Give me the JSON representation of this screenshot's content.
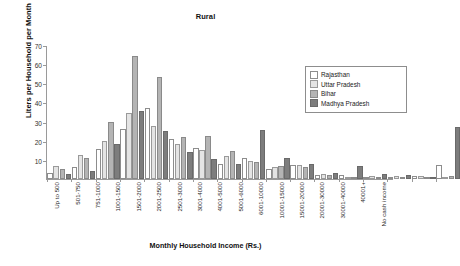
{
  "chart_data": {
    "type": "bar",
    "title": "Rural",
    "xlabel": "Monthly Household Income (Rs.)",
    "ylabel": "Liters per Household per Month",
    "ylim": [
      0,
      70
    ],
    "yticks": [
      0,
      10,
      20,
      30,
      40,
      50,
      60,
      70
    ],
    "ytick_labels": [
      "",
      "10",
      "20",
      "30",
      "40",
      "50",
      "60",
      "70"
    ],
    "grid": false,
    "legend_position": "top-right",
    "categories": [
      "Up to 500",
      "501-750",
      "751-1000",
      "1001-1500",
      "1501-2000",
      "2001-2500",
      "2501-3000",
      "3001-4000",
      "4001-5000",
      "5001-6000",
      "6001-10000",
      "10001-15000",
      "15001-20000",
      "20001-30000",
      "30001-40000",
      "40001+",
      "No cash income"
    ],
    "series": [
      {
        "name": "Rajasthan",
        "color": "#ffffff",
        "values": [
          2.0,
          5.0,
          14.5,
          25.0,
          36.0,
          20.0,
          15.0,
          7.0,
          10.0,
          4.0,
          6.5,
          1.0,
          1.0,
          0.0,
          0.0,
          0.3,
          6.5
        ]
      },
      {
        "name": "Uttar Pradesh",
        "color": "#e4e4e4",
        "values": [
          6.0,
          11.5,
          19.0,
          33.5,
          26.5,
          17.0,
          14.0,
          11.0,
          8.5,
          5.0,
          6.5,
          1.5,
          0.0,
          0.5,
          0.7,
          0.2,
          0.0
        ]
      },
      {
        "name": "Bihar",
        "color": "#b4b4b4",
        "values": [
          4.0,
          10.0,
          29.0,
          63.0,
          52.0,
          21.0,
          21.5,
          13.5,
          8.0,
          6.0,
          5.0,
          1.0,
          0.0,
          0.0,
          0.0,
          0.0,
          0.5
        ]
      },
      {
        "name": "Madhya Pradesh",
        "color": "#7d7d7d",
        "values": [
          1.5,
          3.0,
          17.5,
          34.5,
          24.0,
          13.0,
          9.5,
          7.0,
          24.5,
          10.0,
          7.0,
          2.0,
          6.0,
          1.5,
          1.0,
          0.0,
          26.0
        ]
      }
    ]
  }
}
